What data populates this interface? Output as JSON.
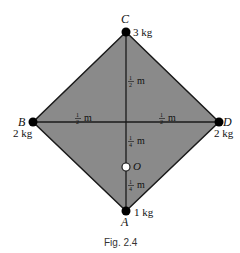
{
  "figure": {
    "caption": "Fig. 2.4",
    "fill_color": "#8a8a8a",
    "line_color": "#1a1a1a"
  },
  "points": {
    "A": {
      "label": "A",
      "mass": "1 kg"
    },
    "B": {
      "label": "B",
      "mass": "2 kg"
    },
    "C": {
      "label": "C",
      "mass": "3 kg"
    },
    "D": {
      "label": "D",
      "mass": "2 kg"
    },
    "O": {
      "label": "O"
    }
  },
  "dimensions": {
    "BO_left": {
      "num": "1",
      "den": "2",
      "unit": "m"
    },
    "OD_right": {
      "num": "1",
      "den": "2",
      "unit": "m"
    },
    "C_to_center": {
      "num": "1",
      "den": "2",
      "unit": "m"
    },
    "center_to_O": {
      "num": "1",
      "den": "4",
      "unit": "m"
    },
    "O_to_A": {
      "num": "1",
      "den": "4",
      "unit": "m"
    }
  }
}
